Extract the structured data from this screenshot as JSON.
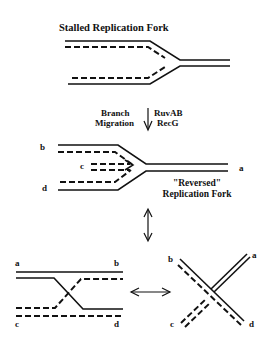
{
  "diagram": {
    "title": "Stalled Replication Fork",
    "step1": {
      "left_label": [
        "Branch",
        "Migration"
      ],
      "right_label": [
        "RuvAB",
        "RecG"
      ]
    },
    "reversed_fork": {
      "caption": [
        "\"Reversed\"",
        "Replication Fork"
      ],
      "end_labels": {
        "a": "a",
        "b": "b",
        "c": "c",
        "d": "d"
      }
    },
    "holliday_left": {
      "end_labels": {
        "a": "a",
        "b": "b",
        "c": "c",
        "d": "d"
      }
    },
    "holliday_right": {
      "end_labels": {
        "a": "a",
        "b": "b",
        "c": "c",
        "d": "d"
      }
    },
    "legend": {
      "solid_line": "parental strand",
      "dashed_line": "nascent strand"
    }
  }
}
